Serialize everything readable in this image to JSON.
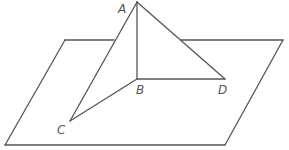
{
  "diagram": {
    "type": "3d-geometry",
    "colors": {
      "line": "#555555",
      "background": "#ffffff"
    },
    "plane": {
      "vertices": [
        [
          65,
          40
        ],
        [
          283,
          40
        ],
        [
          225,
          145
        ],
        [
          5,
          145
        ]
      ]
    },
    "points": [
      {
        "id": "A",
        "label": "A",
        "x": 137,
        "y": 2,
        "label_x": 118,
        "label_y": 13
      },
      {
        "id": "B",
        "label": "B",
        "x": 137,
        "y": 79,
        "label_x": 136,
        "label_y": 94
      },
      {
        "id": "C",
        "label": "C",
        "x": 70,
        "y": 121,
        "label_x": 57,
        "label_y": 134
      },
      {
        "id": "D",
        "label": "D",
        "x": 225,
        "y": 79,
        "label_x": 218,
        "label_y": 94
      }
    ],
    "segments": [
      {
        "from": "A",
        "to": "B"
      },
      {
        "from": "A",
        "to": "C"
      },
      {
        "from": "A",
        "to": "D"
      },
      {
        "from": "B",
        "to": "C"
      },
      {
        "from": "B",
        "to": "D"
      }
    ]
  }
}
